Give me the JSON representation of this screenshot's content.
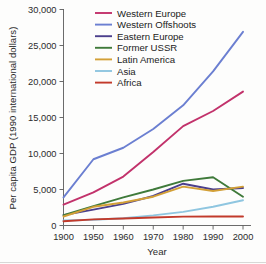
{
  "chart_data": {
    "type": "line",
    "title": "",
    "xlabel": "Year",
    "ylabel": "Per capita GDP (1990 international dollars)",
    "categories": [
      "1900",
      "1950",
      "1960",
      "1970",
      "1980",
      "1990",
      "2000"
    ],
    "x": [
      1900,
      1950,
      1960,
      1970,
      1980,
      1990,
      2000
    ],
    "ylim": [
      0,
      30000
    ],
    "yticks": [
      0,
      5000,
      10000,
      15000,
      20000,
      25000,
      30000
    ],
    "ytick_labels": [
      "0",
      "5,000",
      "10,000",
      "15,000",
      "20,000",
      "25,000",
      "30,000"
    ],
    "xtick_labels": [
      "1900",
      "1950",
      "1960",
      "1970",
      "1980",
      "1990",
      "2000"
    ],
    "grid": false,
    "legend_position": "top-center",
    "series": [
      {
        "name": "Western Europe",
        "color": "#c2326b",
        "values": [
          2900,
          4600,
          6800,
          10200,
          13800,
          15900,
          18600
        ]
      },
      {
        "name": "Western Offshoots",
        "color": "#6b7fd1",
        "values": [
          3900,
          9200,
          10800,
          13400,
          16700,
          21400,
          26900
        ]
      },
      {
        "name": "Eastern Europe",
        "color": "#4b3f8c",
        "values": [
          1450,
          2200,
          3000,
          4100,
          5800,
          5000,
          5200
        ]
      },
      {
        "name": "Former USSR",
        "color": "#3f7a3a",
        "values": [
          1450,
          2700,
          3900,
          5000,
          6200,
          6700,
          4000
        ]
      },
      {
        "name": "Latin America",
        "color": "#d3a037",
        "values": [
          1250,
          2600,
          3200,
          4000,
          5400,
          4800,
          5400
        ]
      },
      {
        "name": "Asia",
        "color": "#8fc6e0",
        "values": [
          700,
          800,
          1000,
          1400,
          1900,
          2600,
          3500
        ]
      },
      {
        "name": "Africa",
        "color": "#c23a2b",
        "values": [
          600,
          850,
          980,
          1120,
          1230,
          1250,
          1250
        ]
      }
    ]
  },
  "legend": {
    "items": [
      {
        "label": "Western Europe",
        "color": "#c2326b"
      },
      {
        "label": "Western Offshoots",
        "color": "#6b7fd1"
      },
      {
        "label": "Eastern Europe",
        "color": "#4b3f8c"
      },
      {
        "label": "Former USSR",
        "color": "#3f7a3a"
      },
      {
        "label": "Latin America",
        "color": "#d3a037"
      },
      {
        "label": "Asia",
        "color": "#8fc6e0"
      },
      {
        "label": "Africa",
        "color": "#c23a2b"
      }
    ]
  }
}
